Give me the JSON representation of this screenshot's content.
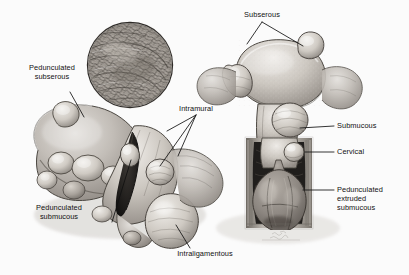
{
  "figure": {
    "background_color": "#fbfbfb",
    "ink_color": "#111111",
    "signature": "Calvin"
  },
  "labels": {
    "pedunculated_subserous": "Pedunculated\nsubserous",
    "subserous": "Subserous",
    "intramural": "Intramural",
    "submucous": "Submucous",
    "cervical": "Cervical",
    "pedunculated_extruded_submucous": "Pedunculated\nextruded\nsubmucous",
    "pedunculated_submucous": "Pedunculated\nsubmucous",
    "intraligamentous": "Intraligamentous"
  },
  "specimens": {
    "inset": "histology-whorl-detail",
    "left": "bisected-uterus-posterior",
    "right": "coronal-uterus-vagina"
  }
}
